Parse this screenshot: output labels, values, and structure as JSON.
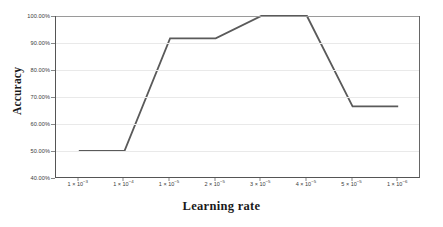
{
  "chart_data": {
    "type": "line",
    "title": "",
    "xlabel": "Learning rate",
    "ylabel": "Accuracy",
    "categories": [
      "1×10−3",
      "1×10−4",
      "1×10−5",
      "2×10−5",
      "3×10−5",
      "4×10−5",
      "5×10−5",
      "1×10−6"
    ],
    "category_parts": [
      {
        "mantissa": "1 × 10",
        "exponent": "−3"
      },
      {
        "mantissa": "1 × 10",
        "exponent": "−4"
      },
      {
        "mantissa": "1 × 10",
        "exponent": "−5"
      },
      {
        "mantissa": "2 × 10",
        "exponent": "−5"
      },
      {
        "mantissa": "3 × 10",
        "exponent": "−5"
      },
      {
        "mantissa": "4 × 10",
        "exponent": "−5"
      },
      {
        "mantissa": "5 × 10",
        "exponent": "−5"
      },
      {
        "mantissa": "1 × 10",
        "exponent": "−6"
      }
    ],
    "values": [
      50.0,
      50.0,
      91.7,
      91.7,
      100.0,
      100.0,
      66.5,
      66.5
    ],
    "ytick_labels": [
      "100.00%",
      "90.00%",
      "80.00%",
      "70.00%",
      "60.00%",
      "50.00%",
      "40.00%"
    ],
    "ytick_values": [
      100,
      90,
      80,
      70,
      60,
      50,
      40
    ],
    "ylim": [
      40,
      100
    ],
    "grid": true,
    "legend": false,
    "series_color": "#5a5a5a",
    "grid_color": "#e9e9e9",
    "axis_color": "#555555"
  }
}
